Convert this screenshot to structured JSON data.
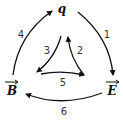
{
  "diagram": {
    "type": "directed-graph",
    "nodes": [
      {
        "id": "q",
        "label": "q",
        "vector": false
      },
      {
        "id": "B",
        "label": "B",
        "vector": true
      },
      {
        "id": "E",
        "label": "E",
        "vector": true
      }
    ],
    "edges": [
      {
        "label": "1",
        "from": "q",
        "to": "E",
        "position": "outer-right"
      },
      {
        "label": "2",
        "from": "inner-bottom-right",
        "to": "inner-top",
        "position": "inner-right"
      },
      {
        "label": "3",
        "from": "inner-top",
        "to": "inner-bottom-left",
        "position": "inner-left"
      },
      {
        "label": "4",
        "from": "B",
        "to": "q",
        "position": "outer-left"
      },
      {
        "label": "5",
        "from": "inner-bottom-left",
        "to": "inner-bottom-right",
        "position": "inner-bottom"
      },
      {
        "label": "6",
        "from": "E",
        "to": "B",
        "position": "outer-bottom"
      }
    ]
  }
}
